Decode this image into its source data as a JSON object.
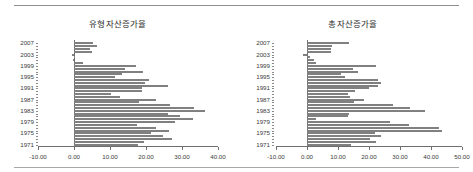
{
  "page": {
    "background": "#ffffff",
    "rule_color": "#9a9a9a",
    "bar_color": "#808080",
    "axis_color": "#6f6f6f"
  },
  "chart_data": [
    {
      "type": "bar",
      "orientation": "horizontal",
      "title": "유형자산증가율",
      "xlabel": "",
      "ylabel": "",
      "xlim": [
        -10.0,
        40.0
      ],
      "xticks": [
        -10.0,
        0.0,
        10.0,
        20.0,
        30.0,
        40.0
      ],
      "xticklabels": [
        "-10.00",
        "0.00",
        "10.00",
        "20.00",
        "30.00",
        "40.00"
      ],
      "grid": false,
      "legend": false,
      "categories": [
        2007,
        2006,
        2005,
        2004,
        2003,
        2002,
        2001,
        2000,
        1999,
        1998,
        1997,
        1996,
        1995,
        1994,
        1993,
        1992,
        1991,
        1990,
        1989,
        1988,
        1987,
        1986,
        1985,
        1984,
        1983,
        1982,
        1981,
        1980,
        1979,
        1978,
        1977,
        1976,
        1975,
        1974,
        1973,
        1972,
        1971
      ],
      "ticklabel_categories": [
        "2007",
        "2003",
        "1999",
        "1995",
        "1991",
        "1987",
        "1983",
        "1979",
        "1975",
        "1971"
      ],
      "values": [
        5.2,
        6.4,
        4.4,
        4.9,
        -0.6,
        0.3,
        -0.4,
        2.5,
        17.1,
        14.1,
        19.1,
        13.4,
        11.3,
        20.9,
        19.7,
        26.0,
        18.8,
        19.0,
        10.4,
        12.8,
        22.8,
        18.0,
        26.8,
        33.4,
        36.4,
        26.0,
        29.4,
        33.0,
        28.0,
        17.6,
        22.9,
        26.4,
        21.5,
        24.7,
        27.2,
        19.4,
        17.8
      ]
    },
    {
      "type": "bar",
      "orientation": "horizontal",
      "title": "총자산증가율",
      "xlabel": "",
      "ylabel": "",
      "xlim": [
        -10.0,
        50.0
      ],
      "xticks": [
        -10.0,
        0.0,
        10.0,
        20.0,
        30.0,
        40.0,
        50.0
      ],
      "xticklabels": [
        "-10.00",
        "0.00",
        "10.00",
        "20.00",
        "30.00",
        "40.00",
        "50.00"
      ],
      "grid": false,
      "legend": false,
      "categories": [
        2007,
        2006,
        2005,
        2004,
        2003,
        2002,
        2001,
        2000,
        1999,
        1998,
        1997,
        1996,
        1995,
        1994,
        1993,
        1992,
        1991,
        1990,
        1989,
        1988,
        1987,
        1986,
        1985,
        1984,
        1983,
        1979,
        1978,
        1977,
        1976,
        1975,
        1974,
        1973,
        1972,
        1971,
        1982,
        1981,
        1980
      ],
      "ticklabel_categories": [
        "2007",
        "2003",
        "1999",
        "1995",
        "1991",
        "1987",
        "1983",
        "1979",
        "1975",
        "1971"
      ],
      "values": [
        13.5,
        8.2,
        7.8,
        7.6,
        -1.2,
        1.1,
        2.4,
        3.0,
        22.2,
        14.7,
        16.4,
        11.1,
        12.2,
        22.9,
        23.9,
        22.9,
        20.0,
        15.6,
        13.1,
        13.8,
        18.4,
        15.3,
        27.6,
        33.3,
        38.2,
        26.7,
        32.9,
        42.6,
        43.4,
        21.8,
        24.0,
        20.3,
        22.1,
        14.3,
        13.4,
        13.2,
        2.9
      ]
    }
  ]
}
